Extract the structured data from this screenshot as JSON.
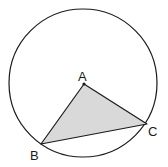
{
  "diagram": {
    "type": "geometry",
    "colors": {
      "stroke": "#1a1a1a",
      "fill": "#d9d9d9",
      "background": "#ffffff"
    },
    "circle": {
      "cx": 83,
      "cy": 83,
      "r": 74
    },
    "points": [
      {
        "name": "A",
        "label": "A",
        "x": 84,
        "y": 84,
        "role": "center"
      },
      {
        "name": "B",
        "label": "B",
        "x": 41,
        "y": 144,
        "role": "on-circle"
      },
      {
        "name": "C",
        "label": "C",
        "x": 147,
        "y": 124,
        "role": "on-circle"
      }
    ],
    "triangle": {
      "vertices": [
        "A",
        "B",
        "C"
      ],
      "shaded": true
    }
  }
}
